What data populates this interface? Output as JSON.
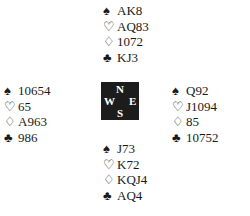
{
  "suit_symbols": {
    "spades": "♠",
    "hearts": "♡",
    "diamonds": "♢",
    "clubs": "♣"
  },
  "compass": {
    "north": "N",
    "south": "S",
    "west": "W",
    "east": "E"
  },
  "hands": {
    "north": {
      "spades": "AK8",
      "hearts": "AQ83",
      "diamonds": "1072",
      "clubs": "KJ3"
    },
    "west": {
      "spades": "10654",
      "hearts": "65",
      "diamonds": "A963",
      "clubs": "986"
    },
    "east": {
      "spades": "Q92",
      "hearts": "J1094",
      "diamonds": "85",
      "clubs": "10752"
    },
    "south": {
      "spades": "J73",
      "hearts": "K72",
      "diamonds": "KQJ4",
      "clubs": "AQ4"
    }
  }
}
